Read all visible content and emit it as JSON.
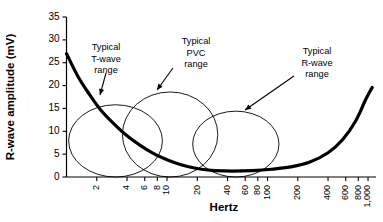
{
  "chart_data": {
    "type": "line",
    "title": "",
    "xlabel": "Hertz",
    "ylabel": "R-wave amplitude (mV)",
    "xscale": "log",
    "xlim": [
      1,
      1200
    ],
    "ylim": [
      0,
      35
    ],
    "grid": false,
    "legend": "none",
    "x_ticks": [
      {
        "value": 2,
        "label": "2"
      },
      {
        "value": 4,
        "label": "4"
      },
      {
        "value": 6,
        "label": "6"
      },
      {
        "value": 8,
        "label": "8"
      },
      {
        "value": 10,
        "label": "10"
      },
      {
        "value": 20,
        "label": "20"
      },
      {
        "value": 40,
        "label": "40"
      },
      {
        "value": 60,
        "label": "60"
      },
      {
        "value": 80,
        "label": "80"
      },
      {
        "value": 100,
        "label": "100"
      },
      {
        "value": 200,
        "label": "200"
      },
      {
        "value": 400,
        "label": "400"
      },
      {
        "value": 600,
        "label": "600"
      },
      {
        "value": 800,
        "label": "800"
      },
      {
        "value": 1000,
        "label": "1,000"
      }
    ],
    "y_ticks": [
      {
        "value": 0,
        "label": "0"
      },
      {
        "value": 5,
        "label": "5"
      },
      {
        "value": 10,
        "label": "10"
      },
      {
        "value": 15,
        "label": "15"
      },
      {
        "value": 20,
        "label": "20"
      },
      {
        "value": 25,
        "label": "25"
      },
      {
        "value": 30,
        "label": "30"
      },
      {
        "value": 35,
        "label": "35"
      }
    ],
    "series": [
      {
        "name": "R-wave amplitude vs frequency",
        "style": "thick-black-curve",
        "points": [
          {
            "x": 1.0,
            "y": 27.0
          },
          {
            "x": 1.3,
            "y": 22.0
          },
          {
            "x": 1.7,
            "y": 18.0
          },
          {
            "x": 2.2,
            "y": 14.6
          },
          {
            "x": 3.0,
            "y": 11.5
          },
          {
            "x": 4.0,
            "y": 9.0
          },
          {
            "x": 5.5,
            "y": 6.8
          },
          {
            "x": 7.0,
            "y": 5.4
          },
          {
            "x": 9.0,
            "y": 4.2
          },
          {
            "x": 12.0,
            "y": 3.1
          },
          {
            "x": 16.0,
            "y": 2.3
          },
          {
            "x": 22.0,
            "y": 1.7
          },
          {
            "x": 30.0,
            "y": 1.4
          },
          {
            "x": 45.0,
            "y": 1.3
          },
          {
            "x": 70.0,
            "y": 1.4
          },
          {
            "x": 110.0,
            "y": 1.7
          },
          {
            "x": 170.0,
            "y": 2.2
          },
          {
            "x": 260.0,
            "y": 3.2
          },
          {
            "x": 400.0,
            "y": 5.3
          },
          {
            "x": 560.0,
            "y": 8.2
          },
          {
            "x": 750.0,
            "y": 12.2
          },
          {
            "x": 950.0,
            "y": 17.0
          },
          {
            "x": 1100.0,
            "y": 19.6
          }
        ]
      }
    ],
    "regions": [
      {
        "id": "t-wave",
        "shape": "ellipse",
        "label": "Typical\nT-wave\nrange",
        "label_lines": [
          "Typical",
          "T-wave",
          "range"
        ],
        "x_range": [
          1.05,
          9.0
        ],
        "y_range": [
          0.0,
          15.8
        ],
        "center_x": 3.0,
        "center_y": 7.9
      },
      {
        "id": "pvc",
        "shape": "ellipse",
        "label": "Typical\nPVC\nrange",
        "label_lines": [
          "Typical",
          "PVC",
          "range"
        ],
        "x_range": [
          3.6,
          32.0
        ],
        "y_range": [
          0.0,
          18.6
        ],
        "center_x": 10.0,
        "center_y": 9.3
      },
      {
        "id": "r-wave",
        "shape": "ellipse",
        "label": "Typical\nR-wave\nrange",
        "label_lines": [
          "Typical",
          "R-wave",
          "range"
        ],
        "x_range": [
          18.0,
          130.0
        ],
        "y_range": [
          0.0,
          14.4
        ],
        "center_x": 45.0,
        "center_y": 7.2
      }
    ],
    "annotations": [
      {
        "id": "t-wave-annotation",
        "lines": [
          "Typical",
          "T-wave",
          "range"
        ],
        "text_x": 106,
        "text_y": 48,
        "arrow_from": [
          106,
          73
        ],
        "arrow_to": [
          100,
          95
        ]
      },
      {
        "id": "pvc-annotation",
        "lines": [
          "Typical",
          "PVC",
          "range"
        ],
        "text_x": 196,
        "text_y": 42,
        "arrow_from": [
          173,
          68
        ],
        "arrow_to": [
          157,
          90
        ]
      },
      {
        "id": "r-wave-annotation",
        "lines": [
          "Typical",
          "R-wave",
          "range"
        ],
        "text_x": 317,
        "text_y": 52,
        "arrow_from": [
          294,
          76
        ],
        "arrow_to": [
          245,
          110
        ]
      }
    ]
  }
}
